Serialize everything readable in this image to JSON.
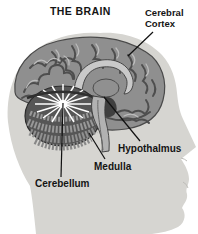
{
  "diagram": {
    "title": "THE BRAIN",
    "labels": {
      "cerebral_cortex": "Cerebral Cortex",
      "hypothalmus": "Hypothalmus",
      "medulla": "Medulla",
      "cerebellum": "Cerebellum"
    },
    "colors": {
      "background": "#ffffff",
      "head_silhouette": "#d6d5d1",
      "brain_base": "#8f8f8f",
      "brain_shadow": "#4e4e4e",
      "brain_highlight": "#bdbdbd",
      "corpus_callosum": "#c9c9c9",
      "cerebellum_dark": "#565656",
      "starburst": "#ffffff",
      "label_text": "#141414",
      "label_line": "#111111"
    }
  }
}
